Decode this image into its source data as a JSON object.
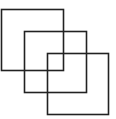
{
  "diagram": {
    "stroke_color": "#222222",
    "background": "#ffffff",
    "shapes": [
      {
        "type": "square",
        "x": 1.5,
        "y": 9.5,
        "size": 62
      },
      {
        "type": "square",
        "x": 24.5,
        "y": 31.5,
        "size": 62
      },
      {
        "type": "square",
        "x": 47.5,
        "y": 53.5,
        "size": 61
      }
    ]
  }
}
